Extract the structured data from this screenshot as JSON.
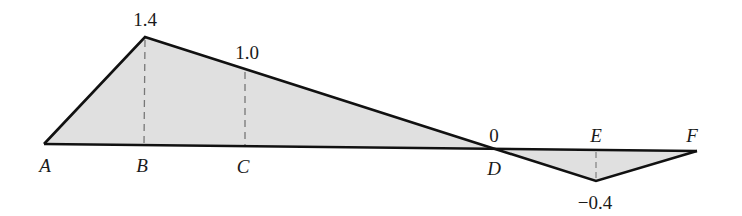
{
  "diagram": {
    "type": "influence-line",
    "fill_color": "#e0e0e0",
    "line_color": "#111111",
    "points": {
      "A": {
        "label": "A",
        "x": 44,
        "base_y": 144,
        "value_y": 144
      },
      "B": {
        "label": "B",
        "x": 145,
        "base_y": 145,
        "value_y": 37,
        "value": "1.4"
      },
      "C": {
        "label": "C",
        "x": 245,
        "base_y": 146,
        "value_y": 70,
        "value": "1.0"
      },
      "D": {
        "label": "D",
        "x": 492,
        "base_y": 148,
        "value_y": 148,
        "value": "0"
      },
      "E": {
        "label": "E",
        "x": 596,
        "base_y": 150,
        "value_y": 181,
        "value": "−0.4"
      },
      "F": {
        "label": "F",
        "x": 697,
        "base_y": 151,
        "value_y": 151
      }
    },
    "value_labels": {
      "B": "1.4",
      "C": "1.0",
      "D": "0",
      "E": "−0.4"
    },
    "point_labels": {
      "A": "A",
      "B": "B",
      "C": "C",
      "D": "D",
      "E": "E",
      "F": "F"
    }
  }
}
